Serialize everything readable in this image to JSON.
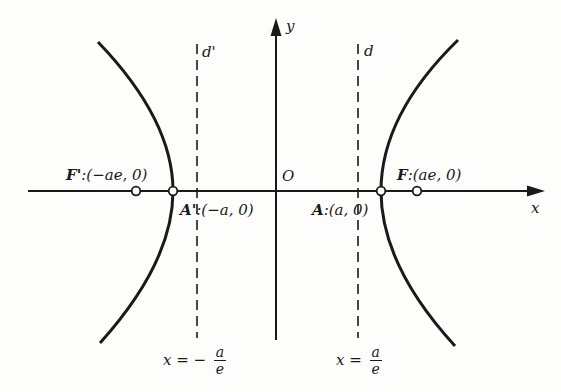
{
  "diagram": {
    "colors": {
      "stroke": "#1a1a1a",
      "background": "#fdfdfb"
    },
    "axes": {
      "x_label": "x",
      "y_label": "y",
      "origin_label": "O"
    },
    "points": {
      "left_focus": {
        "name": "F'",
        "coords": ":(−ae, 0)"
      },
      "right_focus": {
        "name": "F",
        "coords": ":(ae, 0)"
      },
      "left_vertex": {
        "name": "A'",
        "coords": ":(−a, 0)"
      },
      "right_vertex": {
        "name": "A",
        "coords": ":(a, 0)"
      }
    },
    "directrices": {
      "left": {
        "name": "d'",
        "eq_lhs": "x =",
        "eq_sign": "−",
        "num": "a",
        "den": "e"
      },
      "right": {
        "name": "d",
        "eq_lhs": "x =",
        "num": "a",
        "den": "e"
      }
    }
  }
}
